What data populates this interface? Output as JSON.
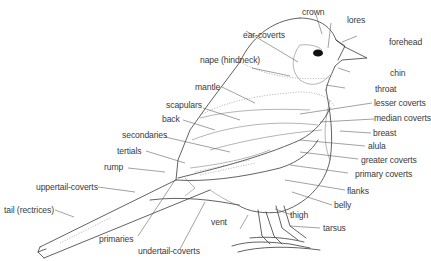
{
  "diagram": {
    "labels": {
      "crown": "crown",
      "lores": "lores",
      "forehead": "forehead",
      "ear_coverts": "ear-coverts",
      "nape": "nape (hindneck)",
      "chin": "chin",
      "throat": "throat",
      "mantle": "mantle",
      "scapulars": "scapulars",
      "back": "back",
      "secondaries": "secondaries",
      "tertials": "tertials",
      "rump": "rump",
      "lesser_coverts": "lesser coverts",
      "median_coverts": "median coverts",
      "breast": "breast",
      "alula": "alula",
      "greater_coverts": "greater coverts",
      "primary_coverts": "primary coverts",
      "flanks": "flanks",
      "belly": "belly",
      "uppertail_coverts": "uppertail-coverts",
      "tail": "tail (rectrices)",
      "thigh": "thigh",
      "tarsus": "tarsus",
      "vent": "vent",
      "primaries": "primaries",
      "undertail_coverts": "undertail-coverts"
    }
  }
}
